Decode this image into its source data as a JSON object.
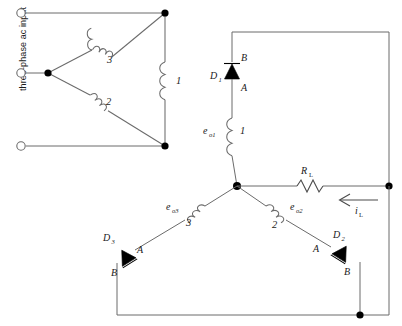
{
  "diagram": {
    "input_label": "three-phase ac input",
    "colors": {
      "wire": "#6b6b6b",
      "node": "#000000",
      "text": "#1a1a1a",
      "background": "#ffffff"
    },
    "delta_windings": [
      {
        "id": "w1",
        "number": "1",
        "position": "right"
      },
      {
        "id": "w2",
        "number": "2",
        "position": "lower-left"
      },
      {
        "id": "w3",
        "number": "3",
        "position": "upper-left"
      }
    ],
    "secondary_windings": [
      {
        "id": "s1",
        "emf": "e",
        "emf_sub": "o1",
        "number": "1",
        "position": "center-vertical"
      },
      {
        "id": "s2",
        "emf": "e",
        "emf_sub": "o2",
        "number": "2",
        "position": "lower-right-branch"
      },
      {
        "id": "s3",
        "emf": "e",
        "emf_sub": "o3",
        "number": "3",
        "position": "lower-left-branch"
      }
    ],
    "diodes": [
      {
        "id": "D1",
        "name": "D",
        "sub": "1",
        "anode": "A",
        "cathode": "B",
        "orientation": "up",
        "anode_position": "below",
        "cathode_position": "above"
      },
      {
        "id": "D2",
        "name": "D",
        "sub": "2",
        "anode": "A",
        "cathode": "B",
        "orientation": "down-right",
        "anode_position": "upper-left",
        "cathode_position": "lower-right"
      },
      {
        "id": "D3",
        "name": "D",
        "sub": "3",
        "anode": "A",
        "cathode": "B",
        "orientation": "up-right",
        "anode_position": "upper-right",
        "cathode_position": "lower-left"
      }
    ],
    "load": {
      "name": "R",
      "sub": "L",
      "type": "resistor"
    },
    "current": {
      "name": "i",
      "sub": "L",
      "direction": "left",
      "arrow": "←"
    },
    "terminals": [
      {
        "id": "t1",
        "label": "",
        "position": "top-left"
      },
      {
        "id": "t2",
        "label": "",
        "position": "middle-left"
      },
      {
        "id": "t3",
        "label": "",
        "position": "bottom-left"
      }
    ],
    "junction_nodes": [
      {
        "id": "n-delta-top",
        "x": 165,
        "y": 13
      },
      {
        "id": "n-delta-left",
        "x": 48,
        "y": 73
      },
      {
        "id": "n-delta-bottom",
        "x": 165,
        "y": 146
      },
      {
        "id": "n-wye-center",
        "x": 237,
        "y": 186
      },
      {
        "id": "n-right-mid",
        "x": 389,
        "y": 186
      },
      {
        "id": "n-bottom-right",
        "x": 360,
        "y": 315
      }
    ]
  }
}
